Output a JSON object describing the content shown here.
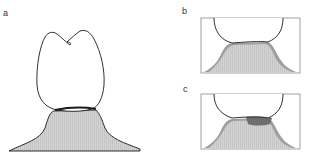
{
  "figure": {
    "panels": [
      {
        "label": "a",
        "description": "Tooth crown sitting on gingiva/bone"
      },
      {
        "label": "b",
        "description": "Close-up of crown margin contact over gingiva"
      },
      {
        "label": "c",
        "description": "Close-up with darker shaded region at crown-gingiva junction"
      }
    ]
  },
  "colors": {
    "outline": "#1a1a1a",
    "gingiva_fill": "#d0d0d0",
    "gingiva_dark": "#9a9a9a",
    "junction_dark": "#6e6e6e",
    "box_stroke": "#888888"
  }
}
